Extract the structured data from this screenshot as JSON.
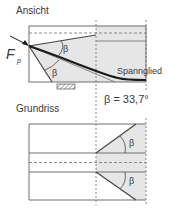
{
  "views": {
    "elevation": {
      "title": "Ansicht"
    },
    "plan": {
      "title": "Grundriss"
    }
  },
  "labels": {
    "force_symbol": "F",
    "force_subscript": "p",
    "tendon": "Spannglied",
    "beta": "β",
    "beta_value": "β = 33,7°"
  },
  "colors": {
    "outline": "#6e6e6e",
    "shade": "#e6e6e6",
    "tendon": "#1a1a1a",
    "text": "#3a3a3a"
  }
}
